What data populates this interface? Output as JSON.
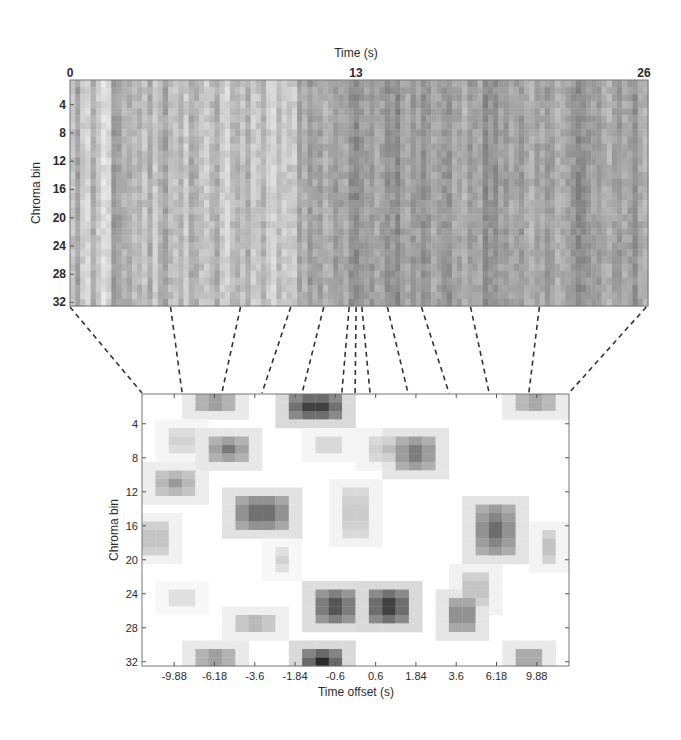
{
  "chart_data": [
    {
      "type": "heatmap",
      "name": "chromagram",
      "title": "",
      "xlabel": "Time (s)",
      "ylabel": "Chroma bin",
      "xlim": [
        0,
        26
      ],
      "ylim": [
        1,
        32
      ],
      "xticks": [
        "0",
        "13",
        "26"
      ],
      "xtick_values": [
        0,
        13,
        26
      ],
      "yticks": [
        "4",
        "8",
        "12",
        "16",
        "20",
        "24",
        "28",
        "32"
      ],
      "ytick_values": [
        4,
        8,
        12,
        16,
        20,
        24,
        28,
        32
      ],
      "colormap": "gray-inverted",
      "column_intensity_profile": [
        0.35,
        0.55,
        0.3,
        0.25,
        0.5,
        0.3,
        0.2,
        0.25,
        0.6,
        0.55,
        0.45,
        0.5,
        0.4,
        0.45,
        0.35,
        0.5,
        0.3,
        0.45,
        0.55,
        0.4,
        0.35,
        0.45,
        0.3,
        0.5,
        0.45,
        0.35,
        0.3,
        0.4,
        0.5,
        0.3,
        0.25,
        0.4,
        0.45,
        0.35,
        0.5,
        0.3,
        0.35,
        0.45,
        0.3,
        0.25,
        0.4,
        0.3,
        0.35,
        0.3,
        0.55,
        0.45,
        0.6,
        0.5,
        0.55,
        0.45,
        0.5,
        0.6,
        0.55,
        0.5,
        0.65,
        0.7,
        0.6,
        0.55,
        0.6,
        0.5,
        0.55,
        0.65,
        0.6,
        0.7,
        0.55,
        0.5,
        0.6,
        0.55,
        0.65,
        0.6,
        0.5,
        0.55,
        0.6,
        0.65,
        0.5,
        0.55,
        0.45,
        0.6,
        0.55,
        0.5,
        0.7,
        0.6,
        0.65,
        0.55,
        0.6,
        0.5,
        0.55,
        0.6,
        0.5,
        0.45,
        0.55,
        0.5,
        0.6,
        0.55,
        0.45,
        0.5,
        0.55,
        0.6,
        0.7,
        0.65,
        0.6,
        0.55,
        0.6,
        0.5,
        0.45,
        0.55,
        0.6,
        0.5,
        0.55,
        0.65,
        0.5,
        0.45
      ]
    },
    {
      "type": "heatmap",
      "name": "offset-patch",
      "title": "",
      "xlabel": "Time offset (s)",
      "ylabel": "Chroma bin",
      "xticks": [
        "-9.88",
        "-6.18",
        "-3.6",
        "-1.84",
        "-0.6",
        "0.6",
        "1.84",
        "3.6",
        "6.18",
        "9.88"
      ],
      "yticks": [
        "4",
        "8",
        "12",
        "16",
        "20",
        "24",
        "28",
        "32"
      ],
      "ytick_values": [
        4,
        8,
        12,
        16,
        20,
        24,
        28,
        32
      ],
      "grid_columns": 32,
      "grid_rows": 32,
      "colormap": "gray-inverted",
      "blobs": [
        {
          "col": 5,
          "row": 1,
          "w": 3,
          "h": 2,
          "v": 0.55
        },
        {
          "col": 12,
          "row": 1,
          "w": 4,
          "h": 3,
          "v": 0.95
        },
        {
          "col": 29,
          "row": 1,
          "w": 3,
          "h": 2,
          "v": 0.5
        },
        {
          "col": 3,
          "row": 5,
          "w": 2,
          "h": 3,
          "v": 0.25
        },
        {
          "col": 6,
          "row": 6,
          "w": 3,
          "h": 3,
          "v": 0.6
        },
        {
          "col": 14,
          "row": 6,
          "w": 2,
          "h": 2,
          "v": 0.25
        },
        {
          "col": 18,
          "row": 6,
          "w": 3,
          "h": 3,
          "v": 0.3
        },
        {
          "col": 20,
          "row": 6,
          "w": 3,
          "h": 4,
          "v": 0.65
        },
        {
          "col": 2,
          "row": 10,
          "w": 3,
          "h": 3,
          "v": 0.45
        },
        {
          "col": 8,
          "row": 13,
          "w": 4,
          "h": 4,
          "v": 0.75
        },
        {
          "col": 16,
          "row": 12,
          "w": 2,
          "h": 6,
          "v": 0.3
        },
        {
          "col": 26,
          "row": 14,
          "w": 3,
          "h": 6,
          "v": 0.7
        },
        {
          "col": 1,
          "row": 16,
          "w": 2,
          "h": 4,
          "v": 0.35
        },
        {
          "col": 31,
          "row": 17,
          "w": 1,
          "h": 4,
          "v": 0.3
        },
        {
          "col": 11,
          "row": 19,
          "w": 1,
          "h": 3,
          "v": 0.2
        },
        {
          "col": 25,
          "row": 22,
          "w": 2,
          "h": 4,
          "v": 0.35
        },
        {
          "col": 3,
          "row": 24,
          "w": 2,
          "h": 2,
          "v": 0.2
        },
        {
          "col": 14,
          "row": 24,
          "w": 3,
          "h": 4,
          "v": 0.85
        },
        {
          "col": 18,
          "row": 24,
          "w": 3,
          "h": 4,
          "v": 0.95
        },
        {
          "col": 24,
          "row": 25,
          "w": 2,
          "h": 4,
          "v": 0.65
        },
        {
          "col": 8,
          "row": 27,
          "w": 3,
          "h": 2,
          "v": 0.4
        },
        {
          "col": 5,
          "row": 31,
          "w": 3,
          "h": 2,
          "v": 0.55
        },
        {
          "col": 13,
          "row": 31,
          "w": 3,
          "h": 3,
          "v": 0.95
        },
        {
          "col": 29,
          "row": 31,
          "w": 2,
          "h": 2,
          "v": 0.55
        }
      ]
    }
  ],
  "connectors": {
    "count": 13,
    "style": "dashed",
    "top_fractions": [
      0.0,
      0.174,
      0.295,
      0.382,
      0.439,
      0.483,
      0.495,
      0.505,
      0.549,
      0.608,
      0.693,
      0.812,
      0.997
    ],
    "bottom_fractions": [
      0.0,
      0.094,
      0.187,
      0.281,
      0.375,
      0.468,
      0.499,
      0.534,
      0.623,
      0.719,
      0.813,
      0.906,
      1.0
    ]
  }
}
